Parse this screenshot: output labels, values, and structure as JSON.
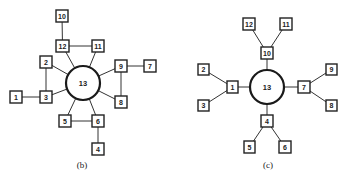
{
  "diagrams": [
    {
      "id": "b",
      "caption": "(b)",
      "caption_pos": [
        82,
        165
      ],
      "hub": {
        "label": "13",
        "cx": 83,
        "cy": 83,
        "r": 17
      },
      "nodes": [
        {
          "label": "10",
          "x": 56,
          "y": 10,
          "w": 12,
          "h": 12
        },
        {
          "label": "12",
          "x": 56,
          "y": 40,
          "w": 13,
          "h": 12
        },
        {
          "label": "11",
          "x": 92,
          "y": 40,
          "w": 12,
          "h": 12
        },
        {
          "label": "2",
          "x": 40,
          "y": 56,
          "w": 12,
          "h": 12
        },
        {
          "label": "9",
          "x": 115,
          "y": 60,
          "w": 12,
          "h": 12
        },
        {
          "label": "7",
          "x": 144,
          "y": 60,
          "w": 12,
          "h": 12
        },
        {
          "label": "1",
          "x": 10,
          "y": 91,
          "w": 12,
          "h": 12
        },
        {
          "label": "3",
          "x": 40,
          "y": 91,
          "w": 12,
          "h": 12
        },
        {
          "label": "8",
          "x": 115,
          "y": 96,
          "w": 12,
          "h": 12
        },
        {
          "label": "5",
          "x": 59,
          "y": 115,
          "w": 12,
          "h": 12
        },
        {
          "label": "6",
          "x": 92,
          "y": 115,
          "w": 12,
          "h": 12
        },
        {
          "label": "4",
          "x": 92,
          "y": 143,
          "w": 12,
          "h": 12
        }
      ],
      "edges": [
        [
          "10",
          "12"
        ],
        [
          "12",
          "11"
        ],
        [
          "12",
          "13"
        ],
        [
          "11",
          "13"
        ],
        [
          "2",
          "13"
        ],
        [
          "2",
          "3"
        ],
        [
          "1",
          "3"
        ],
        [
          "3",
          "13"
        ],
        [
          "9",
          "13"
        ],
        [
          "9",
          "7"
        ],
        [
          "9",
          "8"
        ],
        [
          "8",
          "13"
        ],
        [
          "5",
          "13"
        ],
        [
          "5",
          "6"
        ],
        [
          "6",
          "13"
        ],
        [
          "6",
          "4"
        ]
      ]
    },
    {
      "id": "c",
      "caption": "(c)",
      "caption_pos": [
        268,
        165
      ],
      "hub": {
        "label": "13",
        "cx": 267,
        "cy": 87,
        "r": 17
      },
      "nodes": [
        {
          "label": "12",
          "x": 243,
          "y": 18,
          "w": 12,
          "h": 12
        },
        {
          "label": "11",
          "x": 280,
          "y": 18,
          "w": 12,
          "h": 12
        },
        {
          "label": "10",
          "x": 261,
          "y": 47,
          "w": 12,
          "h": 12
        },
        {
          "label": "2",
          "x": 198,
          "y": 64,
          "w": 11,
          "h": 11
        },
        {
          "label": "1",
          "x": 227,
          "y": 81,
          "w": 11,
          "h": 12
        },
        {
          "label": "3",
          "x": 198,
          "y": 100,
          "w": 11,
          "h": 11
        },
        {
          "label": "7",
          "x": 298,
          "y": 81,
          "w": 12,
          "h": 12
        },
        {
          "label": "9",
          "x": 326,
          "y": 64,
          "w": 11,
          "h": 11
        },
        {
          "label": "8",
          "x": 326,
          "y": 100,
          "w": 11,
          "h": 11
        },
        {
          "label": "4",
          "x": 261,
          "y": 115,
          "w": 12,
          "h": 12
        },
        {
          "label": "5",
          "x": 244,
          "y": 141,
          "w": 11,
          "h": 12
        },
        {
          "label": "6",
          "x": 279,
          "y": 141,
          "w": 12,
          "h": 12
        }
      ],
      "edges": [
        [
          "12",
          "10"
        ],
        [
          "11",
          "10"
        ],
        [
          "10",
          "13"
        ],
        [
          "2",
          "1"
        ],
        [
          "3",
          "1"
        ],
        [
          "1",
          "13"
        ],
        [
          "9",
          "7"
        ],
        [
          "8",
          "7"
        ],
        [
          "7",
          "13"
        ],
        [
          "5",
          "4"
        ],
        [
          "6",
          "4"
        ],
        [
          "4",
          "13"
        ]
      ]
    }
  ],
  "colors": {
    "stroke": "#222222",
    "background": "#ffffff"
  }
}
